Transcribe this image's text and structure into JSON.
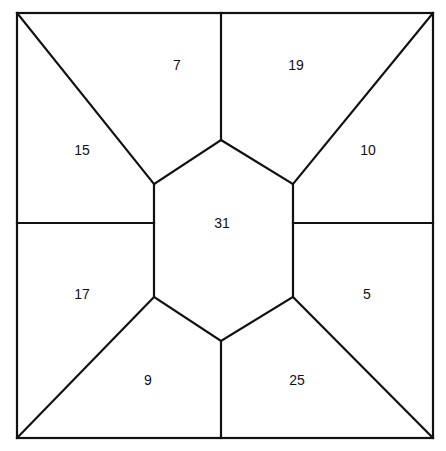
{
  "diagram": {
    "type": "dissected-square-with-central-hexagon",
    "outer_square": {
      "left": 17,
      "top": 13,
      "right": 433,
      "bottom": 438
    },
    "hexagon": {
      "top": [
        221,
        140
      ],
      "upper_left": [
        154,
        184
      ],
      "upper_right": [
        293,
        184
      ],
      "lower_left": [
        154,
        297
      ],
      "lower_right": [
        293,
        297
      ],
      "bottom": [
        221,
        341
      ]
    },
    "regions": [
      {
        "id": "top-left-upper",
        "label": "7",
        "x": 177,
        "y": 66
      },
      {
        "id": "top-right-upper",
        "label": "19",
        "x": 296,
        "y": 66
      },
      {
        "id": "left-upper",
        "label": "15",
        "x": 82,
        "y": 151
      },
      {
        "id": "right-upper",
        "label": "10",
        "x": 368,
        "y": 151
      },
      {
        "id": "center",
        "label": "31",
        "x": 222,
        "y": 224
      },
      {
        "id": "left-lower",
        "label": "17",
        "x": 82,
        "y": 295
      },
      {
        "id": "right-lower",
        "label": "5",
        "x": 367,
        "y": 295
      },
      {
        "id": "bottom-left-lower",
        "label": "9",
        "x": 148,
        "y": 381
      },
      {
        "id": "bottom-right-lower",
        "label": "25",
        "x": 297,
        "y": 381
      }
    ]
  }
}
